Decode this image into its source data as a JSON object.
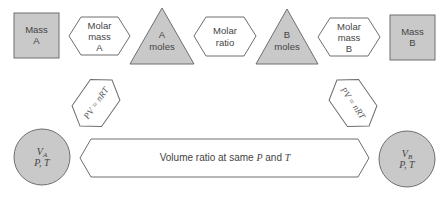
{
  "diagram": {
    "top_row": [
      {
        "id": "mass-a",
        "shape": "square",
        "fill": "#c9c9c9",
        "lines": [
          "Mass",
          "A"
        ]
      },
      {
        "id": "molar-mass-a",
        "shape": "hexagon",
        "fill": "#ffffff",
        "lines": [
          "Molar",
          "mass",
          "A"
        ]
      },
      {
        "id": "a-moles",
        "shape": "triangle",
        "fill": "#c9c9c9",
        "lines": [
          "A",
          "moles"
        ]
      },
      {
        "id": "molar-ratio",
        "shape": "hexagon",
        "fill": "#ffffff",
        "lines": [
          "Molar",
          "ratio"
        ]
      },
      {
        "id": "b-moles",
        "shape": "triangle",
        "fill": "#c9c9c9",
        "lines": [
          "B",
          "moles"
        ]
      },
      {
        "id": "molar-mass-b",
        "shape": "hexagon",
        "fill": "#ffffff",
        "lines": [
          "Molar",
          "mass",
          "B"
        ]
      },
      {
        "id": "mass-b",
        "shape": "square",
        "fill": "#c9c9c9",
        "lines": [
          "Mass",
          "B"
        ]
      }
    ],
    "gas_law_left": {
      "label": "PV = nRT"
    },
    "gas_law_right": {
      "label": "PV = nRT"
    },
    "circle_a": {
      "line1": "V",
      "sub": "A",
      "line2": "P, T"
    },
    "circle_b": {
      "line1": "V",
      "sub": "B",
      "line2": "P, T"
    },
    "volume_ratio": {
      "prefix": "Volume ratio at same ",
      "p": "P",
      "mid": " and ",
      "t": "T"
    },
    "colors": {
      "shaded": "#c9c9c9",
      "stroke": "#6e6e6e",
      "text": "#444444"
    }
  }
}
